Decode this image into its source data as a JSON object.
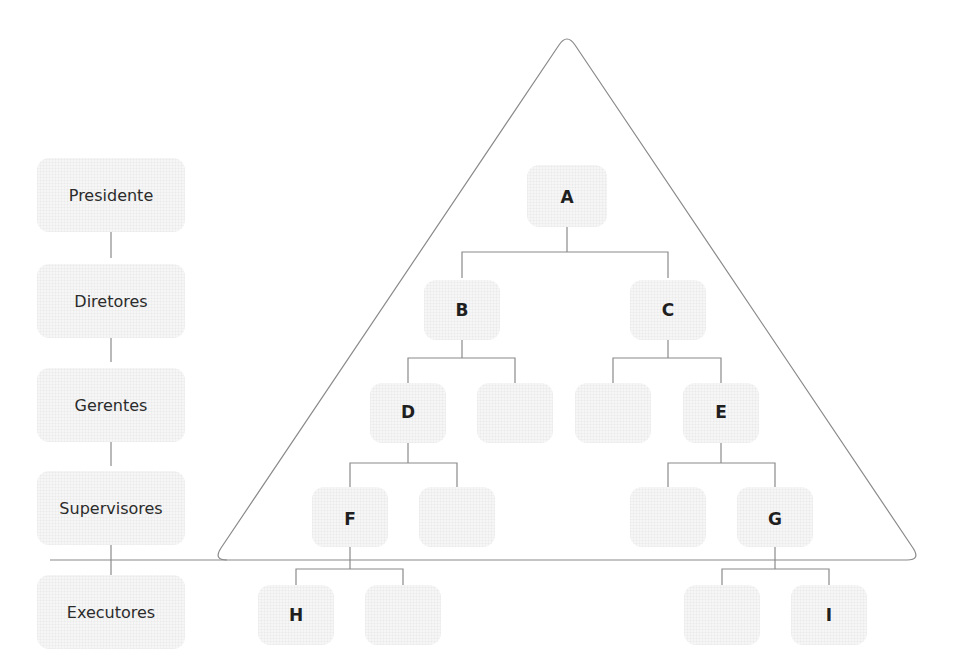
{
  "levels": [
    {
      "label": "Presidente",
      "y": 195
    },
    {
      "label": "Diretores",
      "y": 301
    },
    {
      "label": "Gerentes",
      "y": 405
    },
    {
      "label": "Supervisores",
      "y": 508
    },
    {
      "label": "Executores",
      "y": 612
    }
  ],
  "nodes": {
    "A": {
      "label": "A",
      "x": 567,
      "y": 197
    },
    "B": {
      "label": "B",
      "x": 462,
      "y": 310
    },
    "C": {
      "label": "C",
      "x": 668,
      "y": 310
    },
    "D": {
      "label": "D",
      "x": 408,
      "y": 412
    },
    "E": {
      "label": "E",
      "x": 721,
      "y": 412
    },
    "F": {
      "label": "F",
      "x": 350,
      "y": 519
    },
    "G": {
      "label": "G",
      "x": 775,
      "y": 519
    },
    "H": {
      "label": "H",
      "x": 296,
      "y": 615
    },
    "I": {
      "label": "I",
      "x": 829,
      "y": 615
    }
  },
  "empty_boxes": [
    {
      "x": 515,
      "y": 412
    },
    {
      "x": 613,
      "y": 412
    },
    {
      "x": 457,
      "y": 519
    },
    {
      "x": 668,
      "y": 519
    },
    {
      "x": 403,
      "y": 615
    },
    {
      "x": 722,
      "y": 615
    }
  ],
  "colors": {
    "line": "#8a8a8a",
    "text": "#1f1f1f",
    "box_fill": "#f6f6f6"
  }
}
